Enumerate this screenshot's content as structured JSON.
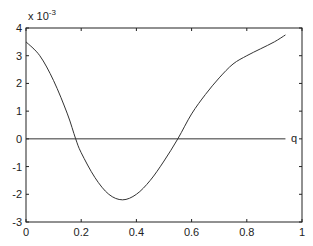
{
  "chart_data": {
    "type": "line",
    "title": "",
    "xlabel": "",
    "ylabel": "",
    "y_scale_exponent": "x 10^-3",
    "xlim": [
      0,
      1
    ],
    "ylim": [
      -3,
      4
    ],
    "grid": false,
    "x_ticks": [
      "0",
      "0.2",
      "0.4",
      "0.6",
      "0.8",
      "1"
    ],
    "y_ticks": [
      "-3",
      "-2",
      "-1",
      "0",
      "1",
      "2",
      "3",
      "4"
    ],
    "series": [
      {
        "name": "curve",
        "x": [
          0,
          0.05,
          0.1,
          0.15,
          0.18,
          0.2,
          0.25,
          0.3,
          0.35,
          0.4,
          0.45,
          0.5,
          0.55,
          0.6,
          0.65,
          0.7,
          0.75,
          0.8,
          0.85,
          0.9,
          0.94
        ],
        "y": [
          3.5,
          3.0,
          2.1,
          0.9,
          0.0,
          -0.5,
          -1.4,
          -2.0,
          -2.2,
          -2.0,
          -1.5,
          -0.8,
          0.0,
          0.9,
          1.6,
          2.2,
          2.7,
          3.0,
          3.25,
          3.5,
          3.75
        ]
      },
      {
        "name": "q",
        "x": [
          0,
          0.94
        ],
        "y": [
          0,
          0
        ]
      }
    ],
    "annotations": [
      {
        "text": "q",
        "x": 0.96,
        "y": 0
      }
    ]
  },
  "labels": {
    "exponent_base": "x 10",
    "exponent_power": "-3",
    "line_label": "q"
  }
}
